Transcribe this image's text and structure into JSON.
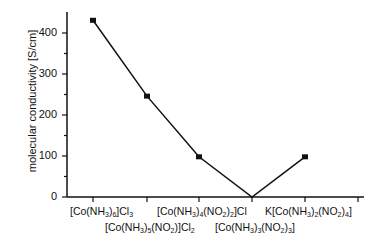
{
  "chart_data": {
    "type": "line",
    "title": "",
    "xlabel": "",
    "ylabel": "molecular conductivity [S/cm]",
    "categories": [
      "[Co(NH3)6]Cl3",
      "[Co(NH3)5(NO2)]Cl2",
      "[Co(NH3)4(NO2)2]Cl",
      "[Co(NH3)3(NO2)3]",
      "K[Co(NH3)2(NO2)4]"
    ],
    "values": [
      431,
      246,
      98,
      0,
      98
    ],
    "ylim": [
      0,
      450
    ],
    "yticks": [
      0,
      100,
      200,
      300,
      400
    ],
    "grid": false,
    "legend": null,
    "marker": "square"
  }
}
